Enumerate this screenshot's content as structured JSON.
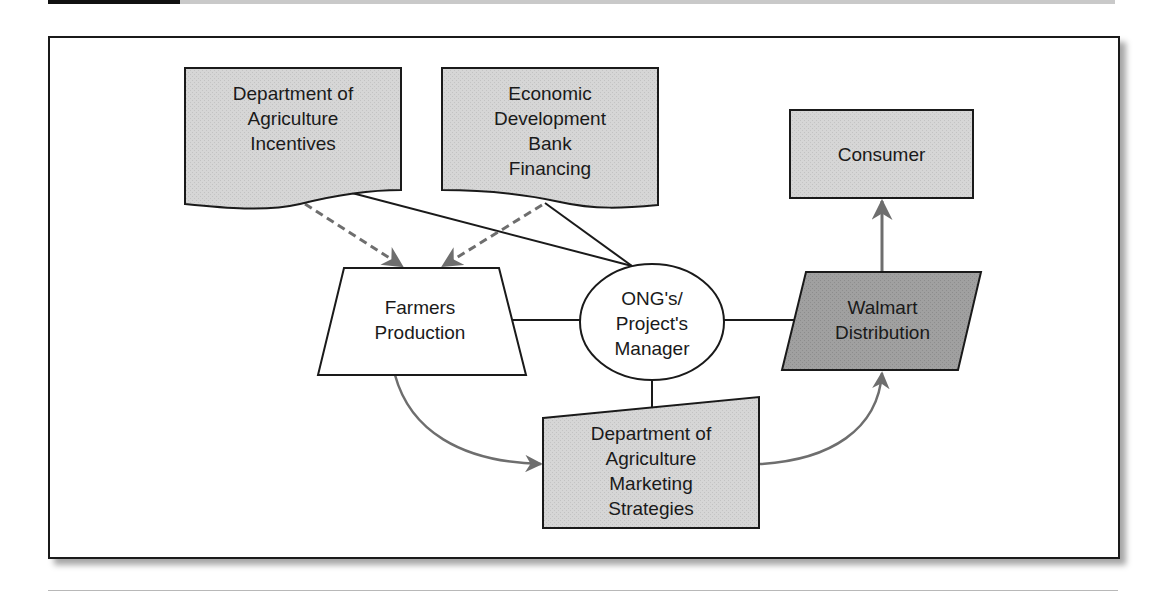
{
  "diagram": {
    "colors": {
      "line": "#1a1a1a",
      "arrow_gray": "#6e6e6e",
      "light_fill": "#d4d4d4",
      "dark_fill": "#9c9c9c",
      "white_fill": "#ffffff"
    },
    "nodes": {
      "ag_incentives": {
        "shape": "document",
        "lines": [
          "Department of",
          "Agriculture",
          "Incentives"
        ]
      },
      "bank_financing": {
        "shape": "document",
        "lines": [
          "Economic",
          "Development",
          "Bank",
          "Financing"
        ]
      },
      "consumer": {
        "shape": "rectangle",
        "lines": [
          "Consumer"
        ]
      },
      "farmers_production": {
        "shape": "trapezoid",
        "lines": [
          "Farmers",
          "Production"
        ]
      },
      "project_manager": {
        "shape": "ellipse",
        "lines": [
          "ONG's/",
          "Project's",
          "Manager"
        ]
      },
      "walmart_distribution": {
        "shape": "parallelogram",
        "lines": [
          "Walmart",
          "Distribution"
        ]
      },
      "marketing_strategies": {
        "shape": "manual-input",
        "lines": [
          "Department of",
          "Agriculture",
          "Marketing",
          "Strategies"
        ]
      }
    },
    "edges": [
      {
        "from": "ag_incentives",
        "to": "farmers_production",
        "style": "dashed-arrow"
      },
      {
        "from": "bank_financing",
        "to": "farmers_production",
        "style": "dashed-arrow"
      },
      {
        "from": "ag_incentives",
        "to": "project_manager",
        "style": "solid-line"
      },
      {
        "from": "bank_financing",
        "to": "project_manager",
        "style": "solid-line"
      },
      {
        "from": "farmers_production",
        "to": "project_manager",
        "style": "solid-line"
      },
      {
        "from": "project_manager",
        "to": "walmart_distribution",
        "style": "solid-line"
      },
      {
        "from": "project_manager",
        "to": "marketing_strategies",
        "style": "solid-line"
      },
      {
        "from": "walmart_distribution",
        "to": "consumer",
        "style": "gray-arrow"
      },
      {
        "from": "farmers_production",
        "to": "marketing_strategies",
        "style": "curved-gray-arrow"
      },
      {
        "from": "marketing_strategies",
        "to": "walmart_distribution",
        "style": "curved-gray-arrow"
      }
    ]
  }
}
